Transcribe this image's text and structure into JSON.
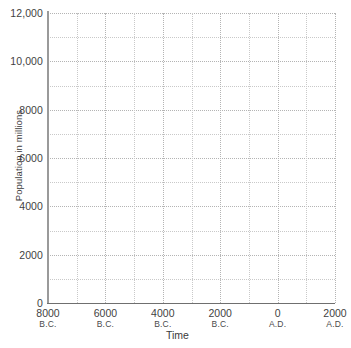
{
  "chart_data": {
    "type": "line",
    "title": "",
    "subtitle": "",
    "xlabel": "Time",
    "ylabel": "Population in millions",
    "series": [],
    "annotations": [],
    "legend": null,
    "grid": true,
    "blank_template": true,
    "x_axis": {
      "label": "Time",
      "min": -8000,
      "max": 2000,
      "major_step": 2000,
      "minor_step": 1000,
      "tick_labels": [
        {
          "value": -8000,
          "number": "8000",
          "era": "B.C."
        },
        {
          "value": -6000,
          "number": "6000",
          "era": "B.C."
        },
        {
          "value": -4000,
          "number": "4000",
          "era": "B.C."
        },
        {
          "value": -2000,
          "number": "2000",
          "era": "B.C."
        },
        {
          "value": 0,
          "number": "0",
          "era": "A.D."
        },
        {
          "value": 2000,
          "number": "2000",
          "era": "A.D."
        }
      ]
    },
    "y_axis": {
      "label": "Population in millions",
      "min": 0,
      "max": 12000,
      "major_step": 2000,
      "minor_step": 1000,
      "tick_labels": [
        {
          "value": 0,
          "text": "0"
        },
        {
          "value": 2000,
          "text": "2000"
        },
        {
          "value": 4000,
          "text": "4000"
        },
        {
          "value": 6000,
          "text": "6000"
        },
        {
          "value": 8000,
          "text": "8000"
        },
        {
          "value": 10000,
          "text": "10,000"
        },
        {
          "value": 12000,
          "text": "12,000"
        }
      ]
    },
    "colors": {
      "background": "#ffffff",
      "gridline_minor": "#c9c9c9",
      "gridline_major": "#b4b4b4",
      "y_axis_line": "#9a9a9a",
      "x_axis_line": "#6f6f6f",
      "text": "#3a3a3a"
    }
  }
}
